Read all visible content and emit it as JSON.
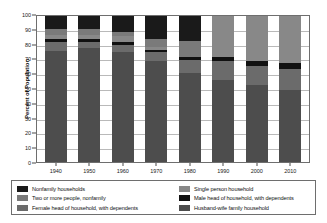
{
  "chart_data": {
    "type": "bar",
    "subtype": "stacked-bar-100",
    "title": "",
    "xlabel": "",
    "ylabel": "Percent of Population",
    "ylim": [
      0,
      100
    ],
    "yticks": [
      0,
      10,
      20,
      30,
      40,
      50,
      60,
      70,
      80,
      90,
      100
    ],
    "grid": true,
    "legend_position": "bottom",
    "categories": [
      "1940",
      "1950",
      "1960",
      "1970",
      "1980",
      "1990",
      "2000",
      "2010"
    ],
    "series": [
      {
        "name": "Husband-wife family household",
        "color": "#4d4d4d",
        "values": [
          76,
          78,
          75,
          69,
          61,
          56,
          53,
          49
        ]
      },
      {
        "name": "Female head of household, with dependents",
        "color": "#6b6b6b",
        "values": [
          6,
          4,
          5,
          6,
          9,
          13,
          13,
          15
        ]
      },
      {
        "name": "Male head of household, with dependents",
        "color": "#111111",
        "values": [
          2,
          2,
          2,
          2,
          2,
          3,
          3,
          4
        ]
      },
      {
        "name": "Single person household",
        "color": "#888888",
        "values": [
          3,
          3,
          4,
          2,
          0,
          28,
          31,
          32
        ]
      },
      {
        "name": "Two or more people, nonfamily",
        "color": "#7a7a7a",
        "values": [
          4,
          4,
          3,
          5,
          11,
          0,
          0,
          0
        ]
      },
      {
        "name": "Nonfamily households",
        "color": "#1a1a1a",
        "values": [
          9,
          9,
          11,
          16,
          17,
          0,
          0,
          0
        ]
      }
    ]
  },
  "axes": {
    "y_title": "Percent of Population"
  },
  "legend": {
    "left_column": [
      {
        "label": "Nonfamily households",
        "color": "#1a1a1a"
      },
      {
        "label": "Two or more people, nonfamily",
        "color": "#7a7a7a"
      },
      {
        "label": "Female head of household, with dependents",
        "color": "#6b6b6b"
      }
    ],
    "right_column": [
      {
        "label": "Single person household",
        "color": "#888888"
      },
      {
        "label": "Male head of household, with dependents",
        "color": "#111111"
      },
      {
        "label": "Husband-wife family household",
        "color": "#4d4d4d"
      }
    ]
  }
}
